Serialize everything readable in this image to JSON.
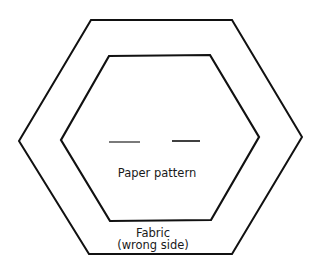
{
  "diagram": {
    "type": "hexagon-template",
    "colors": {
      "stroke": "#111111",
      "background": "#ffffff",
      "text": "#1a1a1a"
    },
    "outer_hexagon": {
      "role": "fabric",
      "points": "91,20 232,20 302,137 232,254 89,254 19,141"
    },
    "inner_hexagon": {
      "role": "paper-pattern",
      "points": "109,56 210,55 259,137 211,220 110,221 61,140"
    },
    "dashes": [
      {
        "x1": 109,
        "y1": 142,
        "x2": 140,
        "y2": 142
      },
      {
        "x1": 172,
        "y1": 141,
        "x2": 200,
        "y2": 141
      }
    ],
    "labels": {
      "paper_pattern": "Paper pattern",
      "fabric": "Fabric",
      "wrong_side": "(wrong side)"
    }
  }
}
